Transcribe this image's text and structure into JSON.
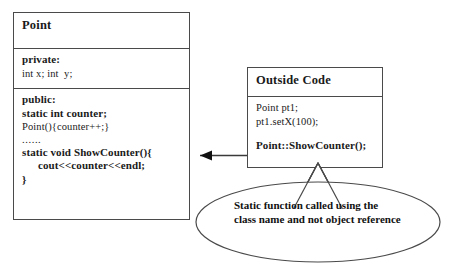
{
  "diagram": {
    "background_color": "#ffffff",
    "line_color": "#4a4a4a",
    "text_color": "#1a1a1a"
  },
  "point_class": {
    "name": "Point",
    "private_section": {
      "label": "private:",
      "members": [
        "int x; int  y;"
      ]
    },
    "public_section": {
      "label": "public:",
      "members": [
        "static int counter;",
        "Point(){counter++;}",
        "......",
        "static void ShowCounter(){",
        "cout<<counter<<endl;",
        "}"
      ]
    }
  },
  "outside_code": {
    "name": "Outside Code",
    "lines": [
      "Point pt1;",
      "pt1.setX(100);",
      "Point::ShowCounter();"
    ]
  },
  "callout": {
    "text": "Static function called using the class name and not object reference"
  },
  "connector": {
    "label": "arrow from Outside Code to Point class"
  }
}
